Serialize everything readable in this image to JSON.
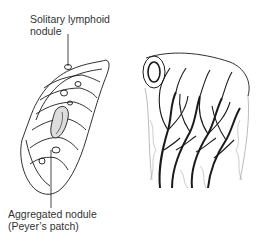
{
  "figure": {
    "labels": {
      "top": [
        "Solitary lymphoid",
        "nodule"
      ],
      "bottom": [
        "Aggregated nodule",
        "(Peyer’s patch)"
      ]
    },
    "panels": [
      {
        "name": "intestinal-wall-cutaway",
        "description": "Opened segment of small intestine showing circular folds with lymphoid nodules"
      },
      {
        "name": "villus-lacteal-network",
        "description": "Cut tube of intestine with branching vessel/lymphatic network"
      }
    ],
    "colors": {
      "ink": "#1a1a1a",
      "text": "#333333",
      "background": "#ffffff"
    }
  }
}
